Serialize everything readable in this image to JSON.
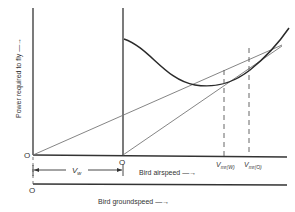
{
  "diagram": {
    "type": "power-curve",
    "y_axis_label": "Power required to fly —→",
    "origin_left": "O",
    "origin_middle": "O",
    "origin_ground": "O",
    "wind_speed_label": "Vw",
    "airspeed_label": "Bird airspeed —→",
    "groundspeed_label": "Bird groundspeed —→",
    "marker_w": "Vmr(W)",
    "marker_0": "Vmr(0)",
    "colors": {
      "axis": "#333333",
      "curve": "#2a2a2a",
      "tangent": "#777777",
      "dashed": "#555555"
    }
  }
}
